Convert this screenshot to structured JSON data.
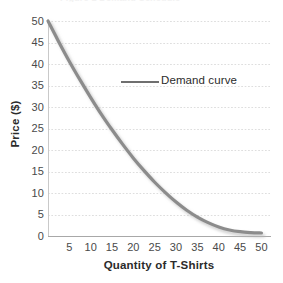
{
  "figure": {
    "title_remnant": "Figure 1  Demand Schedule",
    "background_color": "#ffffff"
  },
  "chart_data": {
    "type": "line",
    "title": "",
    "subtitle": "",
    "xlabel": "Quantity of T-Shirts",
    "ylabel": "Price ($)",
    "xlim": [
      0,
      52
    ],
    "ylim": [
      0,
      50
    ],
    "xticks": [
      5,
      10,
      15,
      20,
      25,
      30,
      35,
      40,
      45,
      50
    ],
    "xtick_labels": [
      "5",
      "10",
      "15",
      "20",
      "25",
      "30",
      "35",
      "40",
      "45",
      "50"
    ],
    "yticks": [
      0,
      5,
      10,
      15,
      20,
      25,
      30,
      35,
      40,
      45,
      50
    ],
    "ytick_labels": [
      "0",
      "5",
      "10",
      "15",
      "20",
      "25",
      "30",
      "35",
      "40",
      "45",
      "50"
    ],
    "grid": "horizontal-dotted",
    "grid_color": "#dedede",
    "legend": "none",
    "series": [
      {
        "name": "Demand curve",
        "color": "#8c8c8c",
        "line_width": 3.2,
        "shadow": true,
        "x": [
          0,
          2.5,
          5,
          7.5,
          10,
          12.5,
          15,
          17.5,
          20,
          22.5,
          25,
          27.5,
          30,
          32.5,
          35,
          37.5,
          40,
          42.5,
          45,
          47.5,
          50
        ],
        "y": [
          50.0,
          45.2,
          40.6,
          36.3,
          32.2,
          28.3,
          24.7,
          21.3,
          18.1,
          15.2,
          12.5,
          10.1,
          7.9,
          6.0,
          4.4,
          3.1,
          2.1,
          1.4,
          1.0,
          0.8,
          0.7
        ]
      }
    ],
    "annotations": [
      {
        "text": "Demand curve",
        "x_value": 26,
        "y_value": 36,
        "leader_from_x_value": 17,
        "leader_to_x_value": 26
      }
    ]
  },
  "axes": {
    "y_axis_color": "#c9c9c9",
    "x_axis_color": "#a8a8a8",
    "tick_label_color": "#4a4a4a",
    "axis_title_color": "#2b2b2b"
  }
}
